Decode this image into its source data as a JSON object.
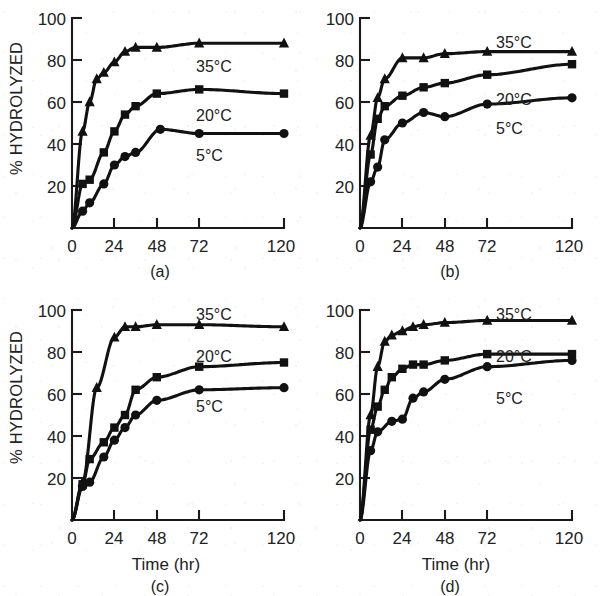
{
  "figure": {
    "title": "",
    "panels": [
      "a",
      "b",
      "c",
      "d"
    ]
  },
  "axes": {
    "ylabel": "% HYDROLYZED",
    "xlabel": "Time (hr)",
    "xticks": [
      0,
      24,
      48,
      72,
      120
    ],
    "xtick_labels": [
      "0",
      "24",
      "48",
      "72",
      "120"
    ],
    "yticks": [
      20,
      40,
      60,
      80,
      100
    ],
    "ytick_labels": [
      "20",
      "40",
      "60",
      "80",
      "100"
    ],
    "xlim": [
      0,
      120
    ],
    "ylim": [
      0,
      100
    ],
    "grid": false
  },
  "captions": {
    "a": "(a)",
    "b": "(b)",
    "c": "(c)",
    "d": "(d)"
  },
  "series_labels": {
    "hot": "35°C",
    "mid": "20°C",
    "cold": "5°C"
  },
  "markers": {
    "hot": "triangle",
    "mid": "square",
    "cold": "circle"
  },
  "colors": {
    "ink": "#111111",
    "axis": "#1a1a1a",
    "text": "#222222",
    "background": "#ffffff"
  },
  "chart_data": [
    {
      "type": "line",
      "panel": "a",
      "title": "(a)",
      "xlabel": "Time (hr)",
      "ylabel": "% HYDROLYZED",
      "xlim": [
        0,
        120
      ],
      "ylim": [
        0,
        100
      ],
      "xticks": [
        0,
        24,
        48,
        72,
        120
      ],
      "yticks": [
        20,
        40,
        60,
        80,
        100
      ],
      "grid": false,
      "legend_position": "inline-right",
      "series": [
        {
          "name": "35°C",
          "marker": "triangle",
          "x": [
            0,
            6,
            10,
            14,
            18,
            24,
            30,
            36,
            48,
            72,
            120
          ],
          "values": [
            0,
            46,
            60,
            71,
            74,
            79,
            84,
            86,
            86,
            88,
            88
          ]
        },
        {
          "name": "20°C",
          "marker": "square",
          "x": [
            0,
            6,
            10,
            18,
            24,
            30,
            36,
            48,
            72,
            120
          ],
          "values": [
            0,
            21,
            23,
            36,
            46,
            54,
            58,
            64,
            66,
            64
          ]
        },
        {
          "name": "5°C",
          "marker": "circle",
          "x": [
            0,
            6,
            10,
            18,
            24,
            30,
            36,
            50,
            72,
            120
          ],
          "values": [
            0,
            8,
            12,
            21,
            30,
            34,
            36,
            47,
            45,
            45
          ]
        }
      ]
    },
    {
      "type": "line",
      "panel": "b",
      "title": "(b)",
      "xlabel": "Time (hr)",
      "ylabel": "% HYDROLYZED",
      "xlim": [
        0,
        120
      ],
      "ylim": [
        0,
        100
      ],
      "xticks": [
        0,
        24,
        48,
        72,
        120
      ],
      "yticks": [
        20,
        40,
        60,
        80,
        100
      ],
      "grid": false,
      "legend_position": "inline-right",
      "series": [
        {
          "name": "35°C",
          "marker": "triangle",
          "x": [
            0,
            6,
            10,
            14,
            24,
            36,
            48,
            72,
            120
          ],
          "values": [
            0,
            44,
            62,
            71,
            81,
            81,
            83,
            84,
            84
          ]
        },
        {
          "name": "20°C",
          "marker": "square",
          "x": [
            0,
            6,
            10,
            14,
            24,
            36,
            48,
            72,
            120
          ],
          "values": [
            0,
            35,
            52,
            58,
            63,
            67,
            69,
            73,
            78
          ]
        },
        {
          "name": "5°C",
          "marker": "circle",
          "x": [
            0,
            6,
            10,
            14,
            24,
            36,
            48,
            72,
            120
          ],
          "values": [
            0,
            22,
            29,
            42,
            50,
            55,
            53,
            59,
            62
          ]
        }
      ]
    },
    {
      "type": "line",
      "panel": "c",
      "title": "(c)",
      "xlabel": "Time (hr)",
      "ylabel": "% HYDROLYZED",
      "xlim": [
        0,
        120
      ],
      "ylim": [
        0,
        100
      ],
      "xticks": [
        0,
        24,
        48,
        72,
        120
      ],
      "yticks": [
        20,
        40,
        60,
        80,
        100
      ],
      "grid": false,
      "legend_position": "inline-right",
      "series": [
        {
          "name": "35°C",
          "marker": "triangle",
          "x": [
            0,
            6,
            14,
            24,
            30,
            36,
            48,
            72,
            120
          ],
          "values": [
            0,
            18,
            63,
            87,
            92,
            92,
            93,
            93,
            92
          ]
        },
        {
          "name": "20°C",
          "marker": "square",
          "x": [
            0,
            6,
            10,
            18,
            24,
            30,
            36,
            48,
            72,
            120
          ],
          "values": [
            0,
            17,
            29,
            37,
            44,
            50,
            62,
            68,
            73,
            75
          ]
        },
        {
          "name": "5°C",
          "marker": "circle",
          "x": [
            0,
            6,
            10,
            18,
            24,
            30,
            36,
            48,
            72,
            120
          ],
          "values": [
            0,
            16,
            18,
            30,
            38,
            44,
            50,
            57,
            62,
            63
          ]
        }
      ]
    },
    {
      "type": "line",
      "panel": "d",
      "title": "(d)",
      "xlabel": "Time (hr)",
      "ylabel": "% HYDROLYZED",
      "xlim": [
        0,
        120
      ],
      "ylim": [
        0,
        100
      ],
      "xticks": [
        0,
        24,
        48,
        72,
        120
      ],
      "yticks": [
        20,
        40,
        60,
        80,
        100
      ],
      "grid": false,
      "legend_position": "inline-right",
      "series": [
        {
          "name": "35°C",
          "marker": "triangle",
          "x": [
            0,
            6,
            10,
            14,
            18,
            24,
            30,
            36,
            48,
            72,
            120
          ],
          "values": [
            0,
            50,
            73,
            85,
            88,
            90,
            92,
            93,
            94,
            95,
            95
          ]
        },
        {
          "name": "20°C",
          "marker": "square",
          "x": [
            0,
            6,
            10,
            14,
            18,
            24,
            30,
            36,
            48,
            72,
            120
          ],
          "values": [
            0,
            43,
            54,
            62,
            68,
            72,
            74,
            74,
            76,
            79,
            79
          ]
        },
        {
          "name": "5°C",
          "marker": "circle",
          "x": [
            0,
            6,
            10,
            18,
            24,
            30,
            36,
            48,
            72,
            120
          ],
          "values": [
            0,
            33,
            42,
            47,
            48,
            58,
            61,
            67,
            73,
            76
          ]
        }
      ]
    }
  ]
}
